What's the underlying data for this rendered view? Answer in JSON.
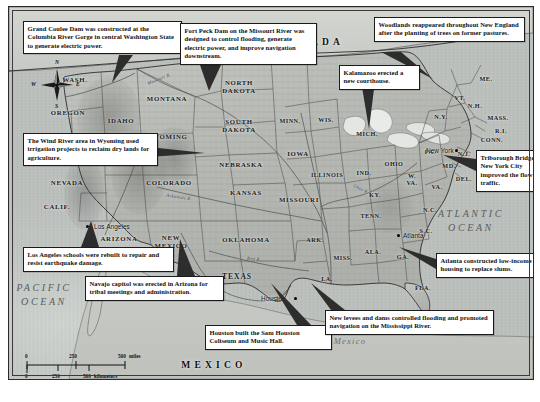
{
  "figure": {
    "type": "thematic-map",
    "title": ""
  },
  "callouts": [
    {
      "id": "grand-coulee",
      "text": "Grand Coulee Dam was constructed at the Columbia River Gorge in central Washington State to generate electric power.",
      "x": 14,
      "y": 14,
      "w": 150,
      "leader": [
        [
          110,
          48
        ],
        [
          124,
          48
        ],
        [
          103,
          76
        ]
      ]
    },
    {
      "id": "fort-peck",
      "text": "Fort Peck Dam on the Missouri River was designed to control flooding, generate electric power, and improve navigation downstream.",
      "x": 171,
      "y": 16,
      "w": 128,
      "leader": [
        [
          191,
          58
        ],
        [
          212,
          58
        ],
        [
          200,
          84
        ]
      ]
    },
    {
      "id": "woodlands-new-england",
      "text": "Woodlands reappeared throughout New England after the planting of trees on former pastures.",
      "x": 365,
      "y": 10,
      "w": 142,
      "leader": [
        [
          372,
          45
        ],
        [
          392,
          45
        ],
        [
          424,
          72
        ]
      ]
    },
    {
      "id": "kalamazoo",
      "text": "Kalamazoo erected a new courthouse.",
      "x": 330,
      "y": 58,
      "w": 72,
      "leader": [
        [
          352,
          74
        ],
        [
          366,
          74
        ],
        [
          360,
          122
        ]
      ]
    },
    {
      "id": "wind-river",
      "text": "The Wind River area in Wyoming used irrigation projects to reclaim dry lands for agriculture.",
      "x": 14,
      "y": 126,
      "w": 126,
      "leader": [
        [
          140,
          140
        ],
        [
          140,
          150
        ],
        [
          196,
          146
        ]
      ]
    },
    {
      "id": "triborough",
      "text": "Triborough Bridge in New York City improved the flow of traffic.",
      "x": 467,
      "y": 143,
      "w": 66,
      "leader": [
        [
          467,
          152
        ],
        [
          467,
          164
        ],
        [
          434,
          148
        ]
      ]
    },
    {
      "id": "los-angeles",
      "text": "Los Angeles schools were rebuilt to repair and resist earthquake damage.",
      "x": 14,
      "y": 240,
      "w": 142,
      "leader": [
        [
          72,
          240
        ],
        [
          90,
          240
        ],
        [
          82,
          214
        ]
      ]
    },
    {
      "id": "navajo-capitol",
      "text": "Navajo capitol was erected in Arizona for tribal meetings and administration.",
      "x": 76,
      "y": 269,
      "w": 130,
      "leader": [
        [
          168,
          269
        ],
        [
          186,
          269
        ],
        [
          171,
          232
        ]
      ]
    },
    {
      "id": "atlanta",
      "text": "Atlanta constructed low-income housing to replace slums.",
      "x": 427,
      "y": 246,
      "w": 104,
      "leader": [
        [
          427,
          252
        ],
        [
          427,
          262
        ],
        [
          390,
          240
        ]
      ]
    },
    {
      "id": "houston",
      "text": "Houston built the Sam Houston Coliseum and Music Hall.",
      "x": 196,
      "y": 318,
      "w": 118,
      "leader": [
        [
          288,
          318
        ],
        [
          302,
          318
        ],
        [
          262,
          276
        ]
      ]
    },
    {
      "id": "mississippi-levees",
      "text": "New levees and dams controlled flooding and promoted navigation on the Mississippi River.",
      "x": 316,
      "y": 303,
      "w": 160,
      "leader": [
        [
          322,
          303
        ],
        [
          336,
          303
        ],
        [
          302,
          276
        ]
      ]
    }
  ],
  "map_labels": {
    "countries": [
      {
        "name": "CANADA",
        "x": 302,
        "y": 35
      },
      {
        "name": "MEXICO",
        "x": 205,
        "y": 358
      }
    ],
    "oceans": [
      {
        "name": "PACIFIC\nOCEAN",
        "x": 35,
        "y": 287
      },
      {
        "name": "ATLANTIC\nOCEAN",
        "x": 462,
        "y": 213
      }
    ],
    "seas": [
      {
        "name": "Gulf of Mexico",
        "x": 323,
        "y": 334
      }
    ],
    "states": [
      {
        "name": "WASH.",
        "x": 66,
        "y": 73,
        "size": "state-md"
      },
      {
        "name": "OREGON",
        "x": 59,
        "y": 106,
        "size": "state-md"
      },
      {
        "name": "IDAHO",
        "x": 112,
        "y": 114,
        "size": "state-md"
      },
      {
        "name": "MONTANA",
        "x": 158,
        "y": 92,
        "size": "state-md"
      },
      {
        "name": "NORTH\nDAKOTA",
        "x": 230,
        "y": 80,
        "size": "state-md"
      },
      {
        "name": "SOUTH\nDAKOTA",
        "x": 230,
        "y": 119,
        "size": "state-md"
      },
      {
        "name": "NEVADA",
        "x": 58,
        "y": 176,
        "size": "state-md"
      },
      {
        "name": "UTAH",
        "x": 110,
        "y": 151,
        "size": "state-md"
      },
      {
        "name": "WYOMING",
        "x": 158,
        "y": 130,
        "size": "state-md"
      },
      {
        "name": "NEBRASKA",
        "x": 232,
        "y": 158,
        "size": "state-md"
      },
      {
        "name": "IOWA",
        "x": 289,
        "y": 147,
        "size": "state-md"
      },
      {
        "name": "MINN.",
        "x": 281,
        "y": 114,
        "size": "state-sm"
      },
      {
        "name": "WIS.",
        "x": 317,
        "y": 113,
        "size": "state-sm"
      },
      {
        "name": "MICH.",
        "x": 358,
        "y": 127,
        "size": "state-sm"
      },
      {
        "name": "ILLINOIS",
        "x": 318,
        "y": 168,
        "size": "state-sm"
      },
      {
        "name": "IND.",
        "x": 355,
        "y": 166,
        "size": "state-sm"
      },
      {
        "name": "OHIO",
        "x": 385,
        "y": 157,
        "size": "state-sm"
      },
      {
        "name": "PA.",
        "x": 421,
        "y": 145,
        "size": "state-sm"
      },
      {
        "name": "N.Y.",
        "x": 432,
        "y": 110,
        "size": "state-sm"
      },
      {
        "name": "ME.",
        "x": 477,
        "y": 72,
        "size": "state-sm"
      },
      {
        "name": "VT.",
        "x": 451,
        "y": 91,
        "size": "state-sm"
      },
      {
        "name": "N.H.",
        "x": 466,
        "y": 99,
        "size": "state-sm"
      },
      {
        "name": "MASS.",
        "x": 489,
        "y": 111,
        "size": "state-sm"
      },
      {
        "name": "R.I.",
        "x": 492,
        "y": 124,
        "size": "state-sm"
      },
      {
        "name": "CONN.",
        "x": 483,
        "y": 133,
        "size": "state-sm"
      },
      {
        "name": "N.J.",
        "x": 455,
        "y": 147,
        "size": "state-sm"
      },
      {
        "name": "MD.",
        "x": 440,
        "y": 159,
        "size": "state-sm"
      },
      {
        "name": "DEL.",
        "x": 455,
        "y": 172,
        "size": "state-sm"
      },
      {
        "name": "W.\nVA.",
        "x": 403,
        "y": 172,
        "size": "state-sm"
      },
      {
        "name": "VA.",
        "x": 428,
        "y": 180,
        "size": "state-sm"
      },
      {
        "name": "COLORADO",
        "x": 160,
        "y": 176,
        "size": "state-md"
      },
      {
        "name": "KANSAS",
        "x": 237,
        "y": 186,
        "size": "state-md"
      },
      {
        "name": "MISSOURI",
        "x": 290,
        "y": 193,
        "size": "state-md"
      },
      {
        "name": "KY.",
        "x": 366,
        "y": 188,
        "size": "state-sm"
      },
      {
        "name": "TENN.",
        "x": 362,
        "y": 209,
        "size": "state-sm"
      },
      {
        "name": "N.C.",
        "x": 421,
        "y": 203,
        "size": "state-sm"
      },
      {
        "name": "S.C.",
        "x": 417,
        "y": 224,
        "size": "state-sm"
      },
      {
        "name": "ARIZONA",
        "x": 110,
        "y": 232,
        "size": "state-md"
      },
      {
        "name": "NEW\nMEXICO",
        "x": 162,
        "y": 235,
        "size": "state-md"
      },
      {
        "name": "OKLAHOMA",
        "x": 237,
        "y": 233,
        "size": "state-md"
      },
      {
        "name": "ARK.",
        "x": 306,
        "y": 233,
        "size": "state-sm"
      },
      {
        "name": "MISS.",
        "x": 334,
        "y": 251,
        "size": "state-sm"
      },
      {
        "name": "ALA.",
        "x": 364,
        "y": 245,
        "size": "state-sm"
      },
      {
        "name": "GA.",
        "x": 394,
        "y": 250,
        "size": "state-sm"
      },
      {
        "name": "LA.",
        "x": 318,
        "y": 272,
        "size": "state-sm"
      },
      {
        "name": "FLA.",
        "x": 414,
        "y": 281,
        "size": "state-sm"
      },
      {
        "name": "CALIF.",
        "x": 48,
        "y": 200,
        "size": "state-md"
      },
      {
        "name": "TEXAS",
        "x": 228,
        "y": 270,
        "size": "state-lg"
      }
    ],
    "cities": [
      {
        "name": "Los Angeles",
        "x": 78,
        "y": 219,
        "dx": 7,
        "dy": -3
      },
      {
        "name": "Houston",
        "x": 286,
        "y": 291,
        "dx": -34,
        "dy": -3
      },
      {
        "name": "Atlanta",
        "x": 389,
        "y": 228,
        "dx": 5,
        "dy": -3
      },
      {
        "name": "New York",
        "x": 447,
        "y": 143,
        "dx": -30,
        "dy": -3
      }
    ],
    "rivers": [
      {
        "name": "Missouri R.",
        "x": 150,
        "y": 72,
        "rot": -22
      },
      {
        "name": "Arkansas R.",
        "x": 170,
        "y": 190,
        "rot": 8
      },
      {
        "name": "Red R.",
        "x": 245,
        "y": 252,
        "rot": 6
      },
      {
        "name": "Ohio R.",
        "x": 352,
        "y": 182,
        "rot": 26
      },
      {
        "name": "Rio Grande",
        "x": 190,
        "y": 281,
        "rot": 62
      }
    ]
  },
  "compass": {
    "north": "N",
    "south": "S",
    "east": "E",
    "west": "W"
  },
  "scale": {
    "miles": {
      "ticks": [
        "0",
        "250",
        "500"
      ],
      "unit": "miles"
    },
    "kilometers": {
      "ticks": [
        "0",
        "250",
        "500"
      ],
      "unit": "kilometers"
    }
  },
  "colors": {
    "land": "#b9bcb6",
    "land_light": "#cfd1cb",
    "ocean": "#c7cbc7",
    "border": "#1b1b1b",
    "callout_bg": "#ffffff",
    "text": "#111111",
    "ocean_text": "#585d5d"
  }
}
